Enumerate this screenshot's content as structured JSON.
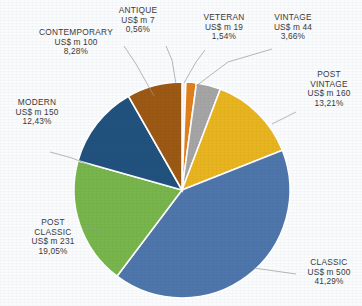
{
  "chart_data": {
    "type": "pie",
    "title": "",
    "currency_prefix": "US$ m",
    "legend_position": "callout-labels",
    "grid": false,
    "total_value": 1211,
    "categories": [
      "ANTIQUE",
      "VETERAN",
      "VINTAGE",
      "POST VINTAGE",
      "CLASSIC",
      "POST CLASSIC",
      "MODERN",
      "CONTEMPORARY"
    ],
    "values": [
      7,
      19,
      44,
      160,
      500,
      231,
      150,
      100
    ],
    "percent_labels": [
      "0,56%",
      "1,54%",
      "3,66%",
      "13,21%",
      "41,29%",
      "19,05%",
      "12,43%",
      "8,28%"
    ],
    "percents": [
      0.56,
      1.54,
      3.66,
      13.21,
      41.29,
      19.05,
      12.43,
      8.28
    ],
    "value_labels": [
      "US$ m 7",
      "US$ m 19",
      "US$ m 44",
      "US$ m 160",
      "US$ m 500",
      "US$ m 231",
      "US$ m 150",
      "US$ m 100"
    ],
    "colors": [
      "#f2f2f2",
      "#e0801c",
      "#a5a5a5",
      "#e8b41f",
      "#4e76ab",
      "#78b54c",
      "#21527e",
      "#9c5914"
    ],
    "slice_border_color": "#ffffff",
    "background_color": "#fafbfc"
  },
  "labels": {
    "antique": {
      "name": "ANTIQUE",
      "value": "US$ m 7",
      "percent": "0,56%"
    },
    "veteran": {
      "name": "VETERAN",
      "value": "US$ m 19",
      "percent": "1,54%"
    },
    "vintage": {
      "name": "VINTAGE",
      "value": "US$ m 44",
      "percent": "3,66%"
    },
    "post_vintage": {
      "name": "POST",
      "name2": "VINTAGE",
      "value": "US$ m 160",
      "percent": "13,21%"
    },
    "classic": {
      "name": "CLASSIC",
      "value": "US$ m 500",
      "percent": "41,29%"
    },
    "post_classic": {
      "name": "POST",
      "name2": "CLASSIC",
      "value": "US$ m 231",
      "percent": "19,05%"
    },
    "modern": {
      "name": "MODERN",
      "value": "US$ m 150",
      "percent": "12,43%"
    },
    "contemporary": {
      "name": "CONTEMPORARY",
      "value": "US$ m 100",
      "percent": "8,28%"
    }
  }
}
